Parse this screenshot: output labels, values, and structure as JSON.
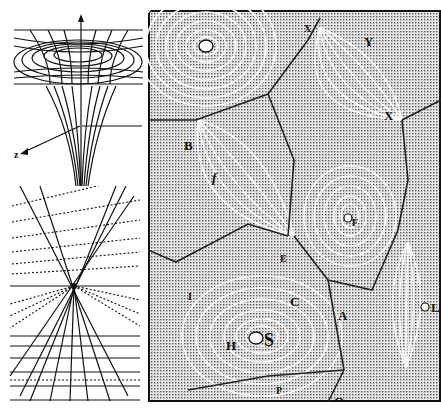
{
  "figure": {
    "panels": {
      "funnel": {
        "title": "gravity-well-funnel-diagram",
        "axis_label": "z"
      },
      "perspective": {
        "title": "converging-lines-perspective-diagram"
      },
      "vortex": {
        "title": "vortex-engraving",
        "labels": {
          "Y": "Y",
          "X_top": "X",
          "X_right": "X",
          "B": "B",
          "f": "f",
          "F": "F",
          "E": "E",
          "I": "I",
          "C": "C",
          "A": "A",
          "L": "L",
          "H": "H",
          "S": "S",
          "P": "P",
          "Q": "Q",
          "D": "D"
        }
      }
    },
    "colors": {
      "ink": "#111111",
      "paper": "#ffffff",
      "stipple": "#cfcfcf"
    }
  }
}
